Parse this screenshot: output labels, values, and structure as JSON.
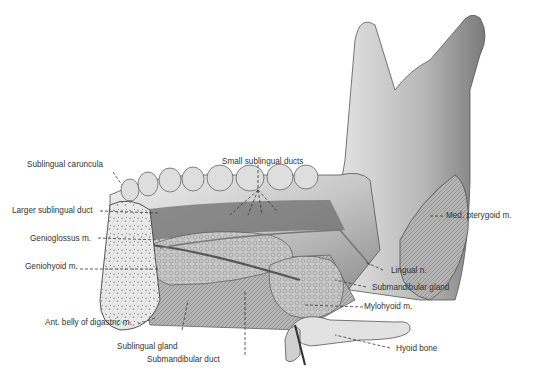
{
  "figure": {
    "labels": {
      "small_sublingual_ducts": "Small sublingual ducts",
      "sublingual_caruncula": "Sublingual caruncula",
      "larger_sublingual_duct": "Larger sublingual duct",
      "genioglossus": "Genioglossus m.",
      "geniohyoid": "Geniohyoid m.",
      "ant_belly_digastric": "Ant. belly of digastric m.",
      "sublingual_gland": "Sublingual gland",
      "submandibular_duct": "Submandibular duct",
      "med_pterygoid": "Med. pterygoid m.",
      "lingual_n": "Lingual n.",
      "submandibular_gland": "Submandibular gland",
      "mylohyoid": "Mylohyoid m.",
      "hyoid_bone": "Hyoid bone"
    }
  }
}
